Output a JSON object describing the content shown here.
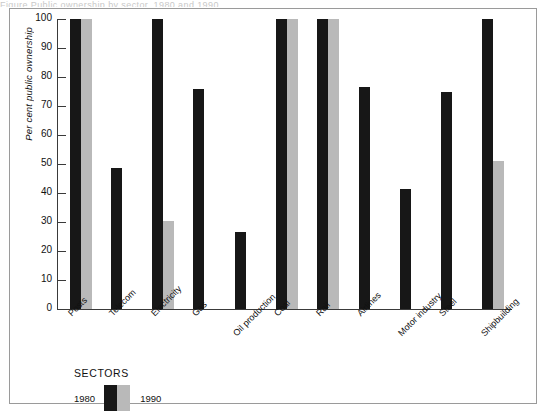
{
  "caption_remnant": "Figure  Public ownership by sector, 1980 and 1990",
  "legend": {
    "title": "SECTORS",
    "entry_1980": "1980",
    "entry_1990": "1990",
    "color_1980": "#171717",
    "color_1990": "#b9b9b9"
  },
  "chart_data": {
    "type": "bar",
    "title": "",
    "xlabel": "",
    "ylabel": "Per cent public ownership",
    "ylim": [
      0,
      100
    ],
    "yticks": [
      0,
      10,
      20,
      30,
      40,
      50,
      60,
      70,
      80,
      90,
      100
    ],
    "grid": false,
    "legend_position": "below-left",
    "categories": [
      "Posts",
      "Telecom",
      "Electricity",
      "Gas",
      "Oil production",
      "Coal",
      "Rail",
      "Airlines",
      "Motor industry",
      "Steel",
      "Shipbuilding"
    ],
    "series": [
      {
        "name": "1980",
        "color": "#171717",
        "values": [
          100,
          48.5,
          100,
          76,
          26.5,
          100,
          100,
          76.5,
          41.5,
          75,
          100
        ]
      },
      {
        "name": "1990",
        "color": "#b9b9b9",
        "values": [
          100,
          0,
          30.5,
          0,
          0,
          100,
          100,
          0,
          0,
          0,
          51
        ]
      }
    ]
  }
}
